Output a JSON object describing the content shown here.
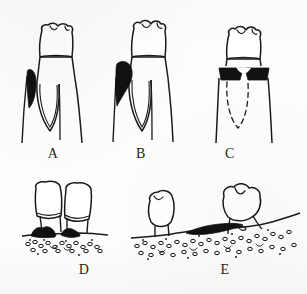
{
  "figure": {
    "background_color": "#fdfdfc",
    "ink_color": "#1a1a1a",
    "fill_color": "#ffffff",
    "lesion_color": "#111111",
    "caption_text": ""
  },
  "panels": [
    {
      "id": "A",
      "label": "A",
      "subject": "single molar with narrow vertical (one-wall) infrabony defect on mesial root",
      "label_x": 41,
      "label_y": 146,
      "features": {
        "crown": "cusped molar crown",
        "roots": 2,
        "lesion": "narrow teardrop black defect, mesial, coronal third of root",
        "lesion_side": "left",
        "dashed_outline": false
      }
    },
    {
      "id": "B",
      "label": "B",
      "subject": "single molar with wider, deeper angular infrabony defect on mesial root",
      "label_x": 129,
      "label_y": 146,
      "features": {
        "crown": "cusped molar crown",
        "roots": 2,
        "lesion": "broad bulbous black defect extending apically along mesial root",
        "lesion_side": "left",
        "dashed_outline": false
      }
    },
    {
      "id": "C",
      "label": "C",
      "subject": "molar with horizontal bone loss on both sides and dashed outline of resorbed bone",
      "label_x": 218,
      "label_y": 146,
      "features": {
        "crown": "cusped molar crown",
        "roots": 2,
        "lesion": "two black triangular wedges flanking the cervical region",
        "lesion_side": "both",
        "dashed_outline": true
      }
    },
    {
      "id": "D",
      "label": "D",
      "subject": "two adjacent tilted crowns with interproximal calculus at the crest and stippled bone",
      "label_x": 72,
      "label_y": 262,
      "features": {
        "crowns": 2,
        "calculus": "black subgingival calculus mounds at crestal bone",
        "bone": "stippled trabecular bone band"
      }
    },
    {
      "id": "E",
      "label": "E",
      "subject": "edentulous-type ridge profile with a drifted crown, calculus ledge and stippled bone",
      "label_x": 213,
      "label_y": 262,
      "features": {
        "crowns": 2,
        "calculus": "long black calculus ledge along the crest between the teeth",
        "bone": "broad stippled trabecular bone band with sloping crest"
      }
    }
  ],
  "labels": {
    "a": "A",
    "b": "B",
    "c": "C",
    "d": "D",
    "e": "E"
  }
}
